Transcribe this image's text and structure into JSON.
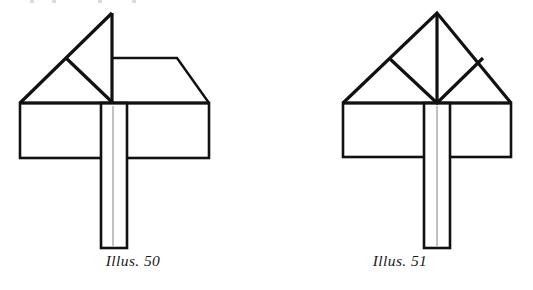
{
  "page": {
    "background_color": "#ffffff",
    "ink_color": "#111111",
    "faint_artifact_color": "#d8d8d8",
    "width": 533,
    "height": 290
  },
  "figures": [
    {
      "id": "illus-50",
      "caption": "Illus. 50",
      "description": "Line drawing of a folded paper/board roof model: a large left-hand triangular gable whose flap is folded upward to create a vertical centre edge, a horizontal ridge running right to a sloping eave, resting on a wide horizontal rectangular base with a narrow vertical post descending through the centre.",
      "parts": {
        "apex_label": "apex",
        "ridge_label": "ridge",
        "base_label": "base rectangle",
        "post_label": "centre post"
      }
    },
    {
      "id": "illus-51",
      "caption": "Illus. 51",
      "description": "Line drawing of a symmetrical triangular roof model: a large isosceles triangle containing an inverted inner triangle formed by two diagonals from the mid-slope points to the base centre, plus a vertical centre line from apex to base, resting on a wide horizontal rectangular base with a narrow vertical post descending through the centre.",
      "parts": {
        "apex_label": "apex",
        "ridge_label": "centre fold",
        "base_label": "base rectangle",
        "post_label": "centre post"
      }
    }
  ]
}
